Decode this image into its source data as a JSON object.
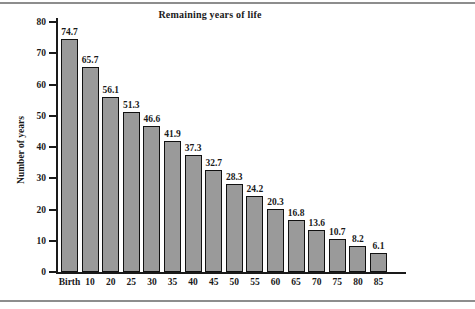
{
  "chart_data": {
    "type": "bar",
    "title": "Remaining years of life",
    "xlabel": "",
    "ylabel": "Number of years",
    "categories": [
      "Birth",
      "10",
      "20",
      "25",
      "30",
      "35",
      "40",
      "45",
      "50",
      "55",
      "60",
      "65",
      "70",
      "75",
      "80",
      "85"
    ],
    "values": [
      74.7,
      65.7,
      56.1,
      51.3,
      46.6,
      41.9,
      37.3,
      32.7,
      28.3,
      24.2,
      20.3,
      16.8,
      13.6,
      10.7,
      8.2,
      6.1
    ],
    "value_labels": [
      "74.7",
      "65.7",
      "56.1",
      "51.3",
      "46.6",
      "41.9",
      "37.3",
      "32.7",
      "28.3",
      "24.2",
      "20.3",
      "16.8",
      "13.6",
      "10.7",
      "8.2",
      "6.1"
    ],
    "ylim": [
      0,
      80
    ],
    "ytick_values": [
      0,
      10,
      20,
      30,
      40,
      50,
      60,
      70,
      80
    ],
    "ytick_labels": [
      "0",
      "10",
      "20",
      "30",
      "40",
      "50",
      "60",
      "70",
      "80"
    ],
    "grid": false,
    "legend": false,
    "bar_color": "#9a9a9a",
    "bar_edge_color": "#111111",
    "axis_color": "#1a1a1a",
    "background_color": "#ffffff"
  }
}
